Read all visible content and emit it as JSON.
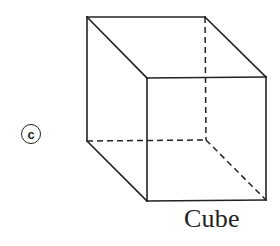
{
  "figure": {
    "option_label": "c",
    "caption": "Cube",
    "shape": "cube",
    "stroke_color": "#222222",
    "background": "#ffffff",
    "vertices": {
      "back_top_left": [
        87,
        17
      ],
      "back_top_right": [
        205,
        17
      ],
      "back_bottom_left": [
        87,
        141
      ],
      "back_bottom_right": [
        206,
        140
      ],
      "front_top_left": [
        147,
        78
      ],
      "front_top_right": [
        266,
        77
      ],
      "front_bottom_left": [
        147,
        201
      ],
      "front_bottom_right": [
        266,
        200
      ]
    },
    "visible_edges": [
      [
        "back_top_left",
        "back_top_right"
      ],
      [
        "back_top_left",
        "back_bottom_left"
      ],
      [
        "back_top_left",
        "front_top_left"
      ],
      [
        "back_top_right",
        "front_top_right"
      ],
      [
        "back_bottom_left",
        "front_bottom_left"
      ],
      [
        "front_top_left",
        "front_top_right"
      ],
      [
        "front_top_left",
        "front_bottom_left"
      ],
      [
        "front_top_right",
        "front_bottom_right"
      ],
      [
        "front_bottom_left",
        "front_bottom_right"
      ]
    ],
    "hidden_edges": [
      [
        "back_top_right",
        "back_bottom_right"
      ],
      [
        "back_bottom_left",
        "back_bottom_right"
      ],
      [
        "back_bottom_right",
        "front_bottom_right"
      ]
    ]
  }
}
